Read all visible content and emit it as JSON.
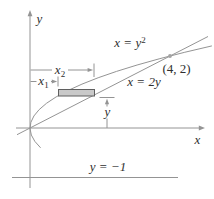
{
  "colors": {
    "stroke": "#949494",
    "text": "#2f2f2f",
    "strip_fill": "#c9c9c9",
    "strip_stroke": "#5f5f5f",
    "dot": "#a3a3a3",
    "background": "#ffffff"
  },
  "labels": {
    "y_axis": "y",
    "x_axis": "x",
    "parabola_base": "x = y",
    "parabola_sup": "2",
    "line": "x = 2y",
    "point": "(4, 2)",
    "x2_base": "x",
    "x2_sub": "2",
    "x1_base": "x",
    "x1_sub": "1",
    "strip_height": "y",
    "horizontal_line": "y = −1"
  }
}
